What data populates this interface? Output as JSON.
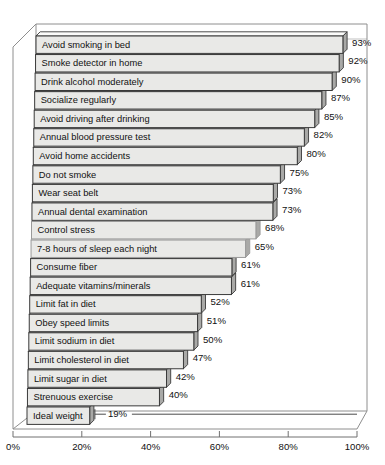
{
  "chart_data": {
    "type": "bar",
    "orientation": "horizontal",
    "title": "",
    "subtitle": "",
    "xlabel": "",
    "ylabel": "",
    "xlim": [
      0,
      100
    ],
    "grid": false,
    "legend": null,
    "xtick_labels": [
      "0%",
      "20%",
      "40%",
      "60%",
      "80%",
      "100%"
    ],
    "xtick_values": [
      0,
      20,
      40,
      60,
      80,
      100
    ],
    "categories": [
      "Avoid smoking in bed",
      "Smoke detector in home",
      "Drink alcohol moderately",
      "Socialize regularly",
      "Avoid driving after drinking",
      "Annual blood pressure test",
      "Avoid home accidents",
      "Do not smoke",
      "Wear seat belt",
      "Annual dental examination",
      "Control stress",
      "7-8 hours of sleep each night",
      "Consume fiber",
      "Adequate vitamins/minerals",
      "Limit fat in diet",
      "Obey speed limits",
      "Limit sodium in diet",
      "Limit cholesterol in diet",
      "Limit sugar in diet",
      "Strenuous exercise",
      "Ideal weight"
    ],
    "values": [
      93,
      92,
      90,
      87,
      85,
      82,
      80,
      75,
      73,
      73,
      68,
      65,
      61,
      61,
      52,
      51,
      50,
      47,
      42,
      40,
      19
    ],
    "value_labels": [
      "93%",
      "92%",
      "90%",
      "87%",
      "85%",
      "82%",
      "80%",
      "75%",
      "73%",
      "73%",
      "68%",
      "65%",
      "61%",
      "61%",
      "52%",
      "51%",
      "50%",
      "47%",
      "42%",
      "40%",
      "19%"
    ]
  },
  "style": {
    "bar_fill": "#e9e9e7",
    "bar_top": "#fbfbfa",
    "bar_side": "#a9a9a7",
    "bar_stroke": "#3a3a3a",
    "frame_stroke": "#8e8e8e",
    "axis_stroke": "#707070",
    "text_color": "#111111",
    "background": "#ffffff"
  }
}
